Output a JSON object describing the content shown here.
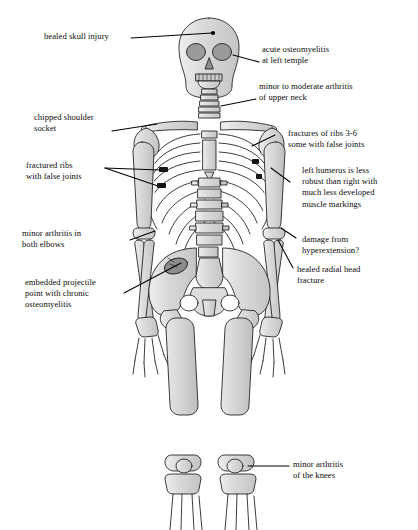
{
  "diagram": {
    "background_color": "#ffffff",
    "bone_fill": "#d9d9d9",
    "bone_outline": "#1a1a1a",
    "lesion_color": "#8f8f8f",
    "leader_color": "#000000"
  },
  "annotations": [
    {
      "id": "healed-skull-injury",
      "text": "healed skull injury"
    },
    {
      "id": "acute-osteomyelitis",
      "text": "acute osteomyelitis\nat left temple"
    },
    {
      "id": "upper-neck-arthritis",
      "text": "minor to moderate arthritis\nof upper neck"
    },
    {
      "id": "chipped-shoulder-socket",
      "text": "chipped shoulder\nsocket"
    },
    {
      "id": "rib-fractures-3-6",
      "text": "fractures of ribs 3-6\nsome with false joints"
    },
    {
      "id": "fractured-ribs-false-joints",
      "text": "fractured ribs\nwith false joints"
    },
    {
      "id": "left-humerus-robusticity",
      "text": "left humerus is less\nrobust than right with\nmuch less developed\nmuscle markings"
    },
    {
      "id": "elbow-arthritis",
      "text": "minor arthritis in\nboth elbows"
    },
    {
      "id": "hyperextension-damage",
      "text": "damage from\nhyperextension?"
    },
    {
      "id": "healed-radial-head",
      "text": "healed radial head\nfracture"
    },
    {
      "id": "embedded-projectile",
      "text": "embedded projectile\npoint with chronic\nosteomyelitis"
    },
    {
      "id": "knee-arthritis",
      "text": "minor arthritis\nof the knees"
    }
  ]
}
